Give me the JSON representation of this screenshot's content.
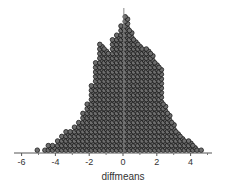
{
  "chart_data": {
    "type": "scatter",
    "subtype": "dot_plot",
    "title": "",
    "xlabel": "diffmeans",
    "ylabel": "",
    "xlim": [
      -6.2,
      5.0
    ],
    "x_ticks": [
      -6,
      -4,
      -2,
      0,
      2,
      4
    ],
    "x_tick_labels": [
      "-6",
      "-4",
      "-2",
      "0",
      "2",
      "4"
    ],
    "grid": false,
    "legend": null,
    "reference_line": {
      "orientation": "vertical",
      "x": 0.05
    },
    "marker": {
      "shape": "circle",
      "fill": "#6e6e6e",
      "edge": "#1a1a1a"
    },
    "columns": [
      {
        "x": -5.0,
        "count": 1
      },
      {
        "x": -4.55,
        "count": 1
      },
      {
        "x": -4.35,
        "count": 2
      },
      {
        "x": -4.1,
        "count": 2
      },
      {
        "x": -3.8,
        "count": 3
      },
      {
        "x": -3.55,
        "count": 4
      },
      {
        "x": -3.3,
        "count": 5
      },
      {
        "x": -3.05,
        "count": 5
      },
      {
        "x": -2.8,
        "count": 6
      },
      {
        "x": -2.55,
        "count": 7
      },
      {
        "x": -2.3,
        "count": 9
      },
      {
        "x": -2.05,
        "count": 11
      },
      {
        "x": -1.8,
        "count": 15
      },
      {
        "x": -1.55,
        "count": 20
      },
      {
        "x": -1.3,
        "count": 24
      },
      {
        "x": -1.05,
        "count": 23
      },
      {
        "x": -0.8,
        "count": 22
      },
      {
        "x": -0.55,
        "count": 25
      },
      {
        "x": -0.3,
        "count": 26
      },
      {
        "x": -0.05,
        "count": 28
      },
      {
        "x": 0.2,
        "count": 30
      },
      {
        "x": 0.45,
        "count": 27
      },
      {
        "x": 0.7,
        "count": 25
      },
      {
        "x": 0.95,
        "count": 24
      },
      {
        "x": 1.2,
        "count": 23
      },
      {
        "x": 1.45,
        "count": 23
      },
      {
        "x": 1.7,
        "count": 22
      },
      {
        "x": 1.95,
        "count": 20
      },
      {
        "x": 2.2,
        "count": 19
      },
      {
        "x": 2.45,
        "count": 11
      },
      {
        "x": 2.7,
        "count": 9
      },
      {
        "x": 2.95,
        "count": 7
      },
      {
        "x": 3.2,
        "count": 5
      },
      {
        "x": 3.45,
        "count": 4
      },
      {
        "x": 3.7,
        "count": 3
      },
      {
        "x": 3.95,
        "count": 3
      },
      {
        "x": 4.2,
        "count": 2
      },
      {
        "x": 4.45,
        "count": 1
      },
      {
        "x": 4.7,
        "count": 1
      }
    ]
  },
  "axis": {
    "xlabel": "diffmeans",
    "ticks": [
      "-6",
      "-4",
      "-2",
      "0",
      "2",
      "4"
    ]
  }
}
